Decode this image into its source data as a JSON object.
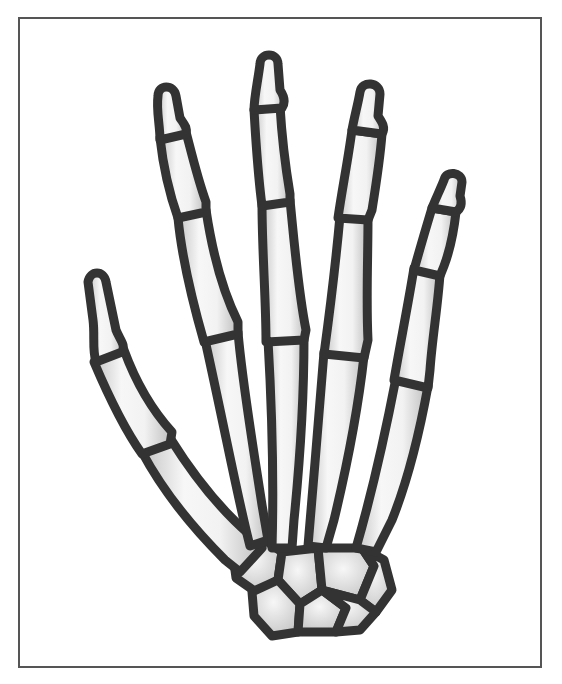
{
  "figure": {
    "outline_color": "#333333",
    "bone_fill_light": "#f6f6f6",
    "bone_fill_shade": "#bdbdbd",
    "frame_color": "#555555",
    "background": "#ffffff"
  },
  "fingers": [
    {
      "name": "thumb"
    },
    {
      "name": "index"
    },
    {
      "name": "middle"
    },
    {
      "name": "ring"
    },
    {
      "name": "little"
    }
  ]
}
